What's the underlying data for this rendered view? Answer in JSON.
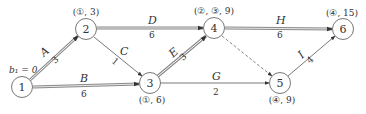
{
  "diagram": {
    "title": "",
    "start_label": "b₁ = 0",
    "nodes": [
      {
        "id": "1",
        "label": "1",
        "x": 22,
        "y": 87,
        "annotation": ""
      },
      {
        "id": "2",
        "label": "2",
        "x": 86,
        "y": 29,
        "annotation": "(①, 3)"
      },
      {
        "id": "3",
        "label": "3",
        "x": 150,
        "y": 83,
        "annotation": "(①, 6)"
      },
      {
        "id": "4",
        "label": "4",
        "x": 214,
        "y": 28,
        "annotation": "(②, ③, 9)"
      },
      {
        "id": "5",
        "label": "5",
        "x": 280,
        "y": 83,
        "annotation": "(④, 9)"
      },
      {
        "id": "6",
        "label": "6",
        "x": 343,
        "y": 29,
        "annotation": "(④, 15)"
      }
    ],
    "edges": [
      {
        "name": "A",
        "duration": "3",
        "from": "1",
        "to": "2",
        "style": "double"
      },
      {
        "name": "B",
        "duration": "6",
        "from": "1",
        "to": "3",
        "style": "double"
      },
      {
        "name": "C",
        "duration": "1",
        "from": "2",
        "to": "3",
        "style": "single"
      },
      {
        "name": "D",
        "duration": "6",
        "from": "2",
        "to": "4",
        "style": "double"
      },
      {
        "name": "E",
        "duration": "3",
        "from": "3",
        "to": "4",
        "style": "double"
      },
      {
        "name": "G",
        "duration": "2",
        "from": "3",
        "to": "5",
        "style": "single"
      },
      {
        "name": "",
        "duration": "",
        "from": "4",
        "to": "5",
        "style": "dashed"
      },
      {
        "name": "H",
        "duration": "6",
        "from": "4",
        "to": "6",
        "style": "double"
      },
      {
        "name": "I",
        "duration": "4",
        "from": "5",
        "to": "6",
        "style": "single"
      }
    ],
    "colors": {
      "line": "#555555",
      "double_line": "#8a8a8a",
      "text": "#333333"
    }
  }
}
